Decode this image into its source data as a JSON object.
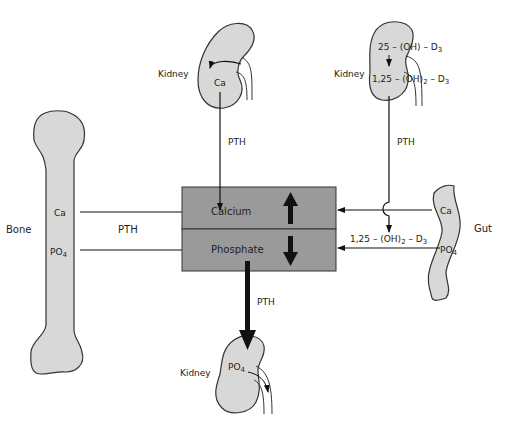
{
  "colors": {
    "organ_fill": "#d8d8d8",
    "box_fill": "#9a9a9a",
    "outline": "#333333",
    "background": "#ffffff"
  },
  "pool_box": {
    "calcium_label": "Calcium",
    "phosphate_label": "Phosphate",
    "calcium_trend": "up",
    "phosphate_trend": "down"
  },
  "kidney_top_left": {
    "label": "Kidney",
    "content": "Ca",
    "hormone": "PTH"
  },
  "kidney_top_right": {
    "label": "Kidney",
    "line1": "25 – (OH) – D",
    "line1_sub": "3",
    "line2_pre": "1,25 – (OH)",
    "line2_sub1": "2",
    "line2_mid": " – D",
    "line2_sub2": "3",
    "hormone": "PTH"
  },
  "bone": {
    "label": "Bone",
    "ca": "Ca",
    "po4": "PO",
    "po4_sub": "4",
    "hormone": "PTH"
  },
  "gut": {
    "label": "Gut",
    "ca": "Ca",
    "po4": "PO",
    "po4_sub": "4",
    "vitd_pre": "1,25 – (OH)",
    "vitd_sub1": "2",
    "vitd_mid": " – D",
    "vitd_sub2": "3"
  },
  "kidney_bottom": {
    "label": "Kidney",
    "content": "PO",
    "content_sub": "4",
    "hormone": "PTH"
  }
}
